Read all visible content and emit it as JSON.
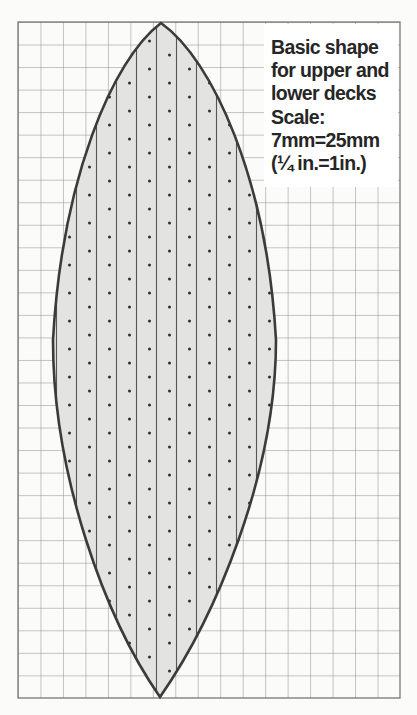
{
  "title": "Basic shape for upper and lower decks",
  "caption": {
    "lines": [
      "Basic shape",
      "for upper and",
      "lower decks",
      "Scale:",
      "7mm=25mm",
      "(¼ in.=1in.)"
    ]
  },
  "scale": {
    "drawing": "7mm=25mm",
    "imperial": "(¼ in.=1in.)"
  },
  "grid": {
    "columns": 17,
    "rows": 30
  },
  "shape": {
    "name": "deck-plan-pointed-oval",
    "stripe_count": 10,
    "texture": "vertical stripes with staggered dot lattice"
  },
  "colors": {
    "page_background": "#fbfbf9",
    "grid_line": "#8b8b8b",
    "grid_border": "#6f6f6f",
    "leaf_fill": "#e3e3e1",
    "leaf_outline": "#3b3b3b",
    "stripe_line": "#565656",
    "dot": "#2e2e2e",
    "caption_background": "#ffffff",
    "caption_text": "#262626"
  }
}
